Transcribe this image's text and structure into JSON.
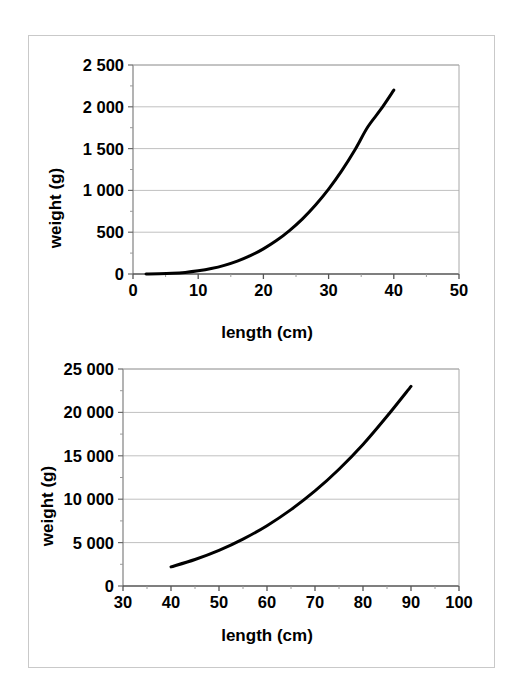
{
  "page": {
    "background_color": "#ffffff",
    "frame_border_color": "#c9c9c9"
  },
  "chart_data": [
    {
      "id": "top",
      "type": "line",
      "title": "",
      "subtitle": "",
      "xlabel": "length (cm)",
      "ylabel": "weight (g)",
      "xlim": [
        0,
        50
      ],
      "ylim": [
        0,
        2500
      ],
      "xticks": [
        0,
        10,
        20,
        30,
        40,
        50
      ],
      "xtick_labels": [
        "0",
        "10",
        "20",
        "30",
        "40",
        "50"
      ],
      "yticks": [
        0,
        500,
        1000,
        1500,
        2000,
        2500
      ],
      "ytick_labels": [
        "0",
        "500",
        "1 000",
        "1 500",
        "2 000",
        "2 500"
      ],
      "grid": "horizontal",
      "grid_color": "#c0c0c0",
      "line_color": "#000000",
      "line_width": 3,
      "legend": "none",
      "series": [
        {
          "name": "weight vs length",
          "x": [
            2,
            4,
            6,
            8,
            10,
            12,
            14,
            16,
            18,
            20,
            22,
            24,
            26,
            28,
            30,
            32,
            34,
            36,
            38,
            40
          ],
          "y": [
            0.3,
            2.5,
            8,
            19,
            38,
            65,
            103,
            154,
            219,
            301,
            400,
            520,
            660,
            825,
            1015,
            1233,
            1480,
            1758,
            1968,
            2200
          ]
        }
      ]
    },
    {
      "id": "bottom",
      "type": "line",
      "title": "",
      "subtitle": "",
      "xlabel": "length (cm)",
      "ylabel": "weight (g)",
      "xlim": [
        30,
        100
      ],
      "ylim": [
        0,
        25000
      ],
      "xticks": [
        30,
        40,
        50,
        60,
        70,
        80,
        90,
        100
      ],
      "xtick_labels": [
        "30",
        "40",
        "50",
        "60",
        "70",
        "80",
        "90",
        "100"
      ],
      "yticks": [
        0,
        5000,
        10000,
        15000,
        20000,
        25000
      ],
      "ytick_labels": [
        "0",
        "5 000",
        "10 000",
        "15 000",
        "20 000",
        "25 000"
      ],
      "grid": "horizontal",
      "grid_color": "#c0c0c0",
      "line_color": "#000000",
      "line_width": 3,
      "legend": "none",
      "series": [
        {
          "name": "weight vs length",
          "x": [
            40,
            45,
            50,
            55,
            60,
            65,
            70,
            75,
            80,
            85,
            90
          ],
          "y": [
            2200,
            3050,
            4100,
            5400,
            6950,
            8800,
            10950,
            13450,
            16300,
            19550,
            23000
          ]
        }
      ]
    }
  ]
}
